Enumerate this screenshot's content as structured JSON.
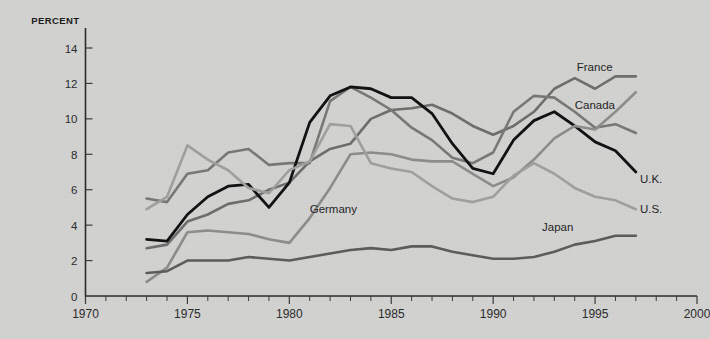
{
  "chart_data": {
    "type": "line",
    "title": "",
    "subtitle": "",
    "ylabel": "PERCENT",
    "xlabel": "",
    "xlim": [
      1970,
      2000
    ],
    "ylim": [
      0,
      15
    ],
    "yticks": [
      0,
      2,
      4,
      6,
      8,
      10,
      12,
      14
    ],
    "xticks": [
      1970,
      1975,
      1980,
      1985,
      1990,
      1995,
      2000
    ],
    "xtick_labels": [
      "1970",
      "1975",
      "1980",
      "1985",
      "1990",
      "1995",
      "2000"
    ],
    "ytick_labels": [
      "0",
      "2",
      "4",
      "6",
      "8",
      "10",
      "12",
      "14"
    ],
    "x_minor_tick_interval": 1,
    "grid": false,
    "legend": "inline-labels-at-line-ends",
    "x": [
      1973,
      1974,
      1975,
      1976,
      1977,
      1978,
      1979,
      1980,
      1981,
      1982,
      1983,
      1984,
      1985,
      1986,
      1987,
      1988,
      1989,
      1990,
      1991,
      1992,
      1993,
      1994,
      1995,
      1996,
      1997
    ],
    "series": [
      {
        "name": "France",
        "color": "#6e6e6c",
        "width": 2.6,
        "label": "France",
        "label_x": 1994.1,
        "label_y": 12.9,
        "values": [
          2.7,
          2.9,
          4.2,
          4.6,
          5.2,
          5.4,
          6.0,
          6.4,
          7.6,
          8.3,
          8.6,
          10.0,
          10.5,
          10.6,
          10.8,
          10.3,
          9.6,
          9.1,
          9.6,
          10.4,
          11.7,
          12.3,
          11.7,
          12.4,
          12.4
        ]
      },
      {
        "name": "Canada",
        "color": "#787877",
        "width": 2.6,
        "label": "Canada",
        "label_x": 1994.0,
        "label_y": 10.8,
        "values": [
          5.5,
          5.3,
          6.9,
          7.1,
          8.1,
          8.3,
          7.4,
          7.5,
          7.5,
          11.0,
          11.8,
          11.2,
          10.5,
          9.5,
          8.8,
          7.8,
          7.5,
          8.1,
          10.4,
          11.3,
          11.2,
          10.4,
          9.5,
          9.7,
          9.2
        ]
      },
      {
        "name": "U.K.",
        "color": "#111111",
        "width": 2.8,
        "label": "U.K.",
        "label_x": 1997.2,
        "label_y": 6.6,
        "values": [
          3.2,
          3.1,
          4.6,
          5.6,
          6.2,
          6.3,
          5.0,
          6.4,
          9.8,
          11.3,
          11.8,
          11.7,
          11.2,
          11.2,
          10.3,
          8.6,
          7.2,
          6.9,
          8.8,
          9.9,
          10.4,
          9.6,
          8.7,
          8.2,
          7.0
        ]
      },
      {
        "name": "Germany",
        "color": "#8d8d8b",
        "width": 2.6,
        "label": "Germany",
        "label_x": 1981.0,
        "label_y": 4.9,
        "values": [
          0.8,
          1.6,
          3.6,
          3.7,
          3.6,
          3.5,
          3.2,
          3.0,
          4.4,
          6.1,
          8.0,
          8.1,
          8.0,
          7.7,
          7.6,
          7.6,
          6.9,
          6.2,
          6.7,
          7.7,
          8.9,
          9.6,
          9.4,
          10.4,
          11.5
        ]
      },
      {
        "name": "U.S.",
        "color": "#a0a09e",
        "width": 2.6,
        "label": "U.S.",
        "label_x": 1997.2,
        "label_y": 4.9,
        "values": [
          4.9,
          5.6,
          8.5,
          7.7,
          7.1,
          6.1,
          5.8,
          7.1,
          7.6,
          9.7,
          9.6,
          7.5,
          7.2,
          7.0,
          6.2,
          5.5,
          5.3,
          5.6,
          6.8,
          7.5,
          6.9,
          6.1,
          5.6,
          5.4,
          4.9
        ]
      },
      {
        "name": "Japan",
        "color": "#5c5c5a",
        "width": 2.6,
        "label": "Japan",
        "label_x": 1992.4,
        "label_y": 3.9,
        "values": [
          1.3,
          1.4,
          2.0,
          2.0,
          2.0,
          2.2,
          2.1,
          2.0,
          2.2,
          2.4,
          2.6,
          2.7,
          2.6,
          2.8,
          2.8,
          2.5,
          2.3,
          2.1,
          2.1,
          2.2,
          2.5,
          2.9,
          3.1,
          3.4,
          3.4
        ]
      }
    ]
  },
  "axis": {
    "percent_label": "PERCENT"
  }
}
